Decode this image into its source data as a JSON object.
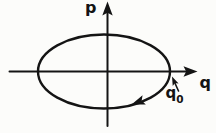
{
  "figure": {
    "kind": "phase-space-ellipse-diagram",
    "labels": {
      "p_axis": "p",
      "q_axis": "q",
      "q0_base": "q",
      "q0_sub": "0"
    },
    "colors": {
      "ink": "#141414",
      "background": "#fcfcfa"
    }
  }
}
